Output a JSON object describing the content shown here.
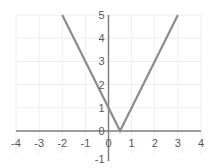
{
  "chart_data": {
    "type": "line",
    "title": "",
    "xlabel": "",
    "ylabel": "",
    "function": "y = |2x - 1|",
    "xlim": [
      -4,
      4
    ],
    "ylim": [
      -1,
      5
    ],
    "grid": true,
    "legend": null,
    "x_ticks": [
      "-4",
      "-3",
      "-2",
      "-1",
      "0",
      "1",
      "2",
      "3",
      "4"
    ],
    "y_ticks": [
      "-1",
      "0",
      "1",
      "2",
      "3",
      "4",
      "5"
    ],
    "series": [
      {
        "name": "y = |2x - 1|",
        "x": [
          -2,
          0,
          0.5,
          3
        ],
        "y": [
          5,
          1,
          0,
          5
        ]
      }
    ],
    "colors": {
      "line": "#8c8c8c",
      "axis": "#7f7f7f",
      "grid": "#eeeeee",
      "tick_label": "#595959"
    }
  }
}
